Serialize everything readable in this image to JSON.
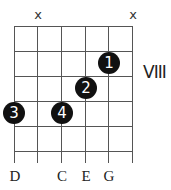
{
  "chord_diagram": {
    "position_label": "VIII",
    "strings": 6,
    "frets_shown": 5,
    "muted_strings": [
      {
        "string": 2,
        "symbol": "x"
      },
      {
        "string": 6,
        "symbol": "x"
      }
    ],
    "fingers": [
      {
        "finger": "1",
        "string": 5,
        "fret": 2
      },
      {
        "finger": "2",
        "string": 4,
        "fret": 3
      },
      {
        "finger": "3",
        "string": 1,
        "fret": 4
      },
      {
        "finger": "4",
        "string": 3,
        "fret": 4
      }
    ],
    "note_labels": [
      {
        "string": 1,
        "note": "D"
      },
      {
        "string": 3,
        "note": "C"
      },
      {
        "string": 4,
        "note": "E"
      },
      {
        "string": 5,
        "note": "G"
      }
    ]
  }
}
